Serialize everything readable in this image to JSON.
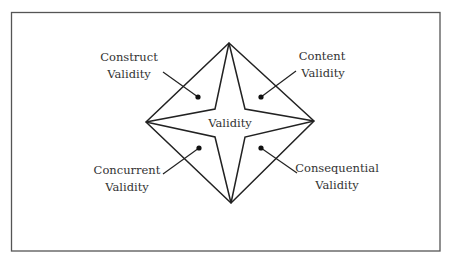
{
  "diagram": {
    "center_label": "Validity",
    "labels": [
      {
        "line1": "Construct",
        "line2": "Validity"
      },
      {
        "line1": "Content",
        "line2": "Validity"
      },
      {
        "line1": "Concurrent",
        "line2": "Validity"
      },
      {
        "line1": "Consequential",
        "line2": "Validity"
      }
    ]
  }
}
